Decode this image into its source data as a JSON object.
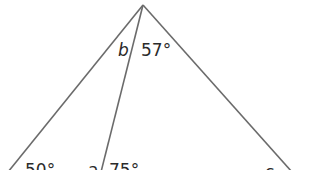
{
  "diagram": {
    "type": "triangle-with-cevian",
    "line_color": "#6b6b6b",
    "labels": {
      "top_left_angle": "b",
      "top_right_angle": "57°",
      "bottom_left_angle": "50°",
      "cevian_left_angle": "a",
      "cevian_right_angle": "75°",
      "bottom_right_angle": "c"
    }
  }
}
